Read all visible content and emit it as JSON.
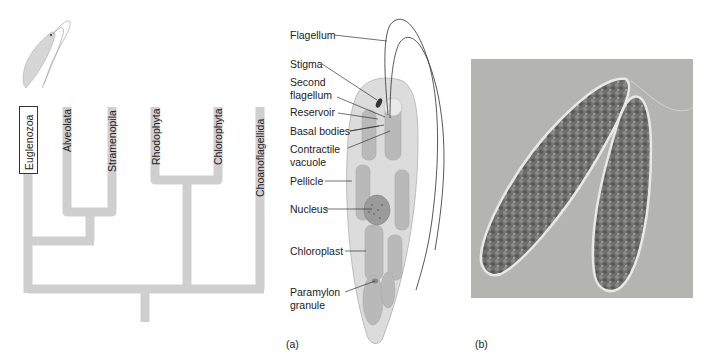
{
  "tree": {
    "taxa": [
      {
        "label": "Euglenozoa",
        "highlighted": true
      },
      {
        "label": "Alveolata"
      },
      {
        "label": "Stramenopila"
      },
      {
        "label": "Rhodophyta"
      },
      {
        "label": "Chlorophyta"
      },
      {
        "label": "Choanoflagellida"
      }
    ],
    "branch_color": "#cfcfcf"
  },
  "panel_a": {
    "letter": "(a)",
    "callouts": [
      {
        "label": "Flagellum"
      },
      {
        "label": "Stigma"
      },
      {
        "label": "Second\nflagellum"
      },
      {
        "label": "Reservoir"
      },
      {
        "label": "Basal bodies"
      },
      {
        "label": "Contractile\nvacuole"
      },
      {
        "label": "Pellicle"
      },
      {
        "label": "Nucleus"
      },
      {
        "label": "Chloroplast"
      },
      {
        "label": "Paramylon\ngranule"
      }
    ]
  },
  "panel_b": {
    "letter": "(b)",
    "photo_background": "#b4b4b0"
  }
}
